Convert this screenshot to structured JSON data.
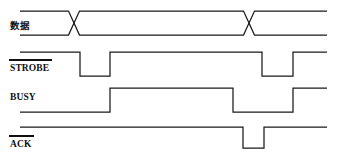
{
  "figure": {
    "kind": "digital-timing-diagram",
    "background_color": "#ffffff",
    "line_color": "#1a1a1a",
    "width": 341,
    "height": 159
  },
  "signals": [
    {
      "name": "data",
      "label": "数据",
      "label_script": "cjk",
      "active_low": false,
      "overbar": false,
      "type": "bus",
      "label_x": 10,
      "label_y": 29,
      "top_y": 11,
      "bottom_y": 35,
      "start_x": 20,
      "end_x": 327,
      "crossings": [
        74,
        249
      ],
      "crossing_width": 11
    },
    {
      "name": "strobe",
      "label": "STROBE",
      "label_script": "latin",
      "active_low": true,
      "overbar": true,
      "type": "logic",
      "label_x": 10,
      "label_y": 71,
      "overbar_x1": 9,
      "overbar_x2": 52,
      "overbar_y": 60,
      "high_y": 52,
      "low_y": 76,
      "start_x": 20,
      "end_x": 327,
      "initial_level": "high",
      "edges": [
        {
          "x": 80,
          "to": "low"
        },
        {
          "x": 110,
          "to": "high"
        },
        {
          "x": 262,
          "to": "low"
        },
        {
          "x": 293,
          "to": "high"
        }
      ]
    },
    {
      "name": "busy",
      "label": "BUSY",
      "label_script": "latin",
      "active_low": false,
      "overbar": false,
      "type": "logic",
      "label_x": 10,
      "label_y": 100,
      "high_y": 88,
      "low_y": 112,
      "start_x": 20,
      "end_x": 327,
      "initial_level": "low",
      "edges": [
        {
          "x": 110,
          "to": "high"
        },
        {
          "x": 233,
          "to": "low"
        },
        {
          "x": 293,
          "to": "high"
        }
      ]
    },
    {
      "name": "ack",
      "label": "ACK",
      "label_script": "latin",
      "active_low": true,
      "overbar": true,
      "type": "logic",
      "label_x": 10,
      "label_y": 147,
      "overbar_x1": 9,
      "overbar_x2": 34,
      "overbar_y": 136,
      "high_y": 127,
      "low_y": 148,
      "start_x": 20,
      "end_x": 327,
      "initial_level": "high",
      "edges": [
        {
          "x": 243,
          "to": "low"
        },
        {
          "x": 264,
          "to": "high"
        }
      ]
    }
  ],
  "chart_data": {
    "type": "line",
    "xlabel": "",
    "ylabel": "",
    "x": [
      20,
      74,
      80,
      110,
      233,
      243,
      249,
      264,
      293,
      327
    ],
    "series": [
      {
        "name": "数据",
        "kind": "bus",
        "values": [
          "valid",
          "transition",
          "valid",
          "valid",
          "valid",
          "valid",
          "transition",
          "valid",
          "valid",
          "valid"
        ]
      },
      {
        "name": "STROBE",
        "kind": "logic-active-low",
        "values": [
          1,
          1,
          0,
          1,
          1,
          1,
          1,
          1,
          1,
          1
        ]
      },
      {
        "name": "BUSY",
        "kind": "logic-active-high",
        "values": [
          0,
          0,
          0,
          1,
          0,
          0,
          0,
          0,
          1,
          1
        ]
      },
      {
        "name": "ACK",
        "kind": "logic-active-low",
        "values": [
          1,
          1,
          1,
          1,
          1,
          0,
          0,
          1,
          1,
          1
        ]
      }
    ],
    "legend": "none",
    "grid": false
  }
}
